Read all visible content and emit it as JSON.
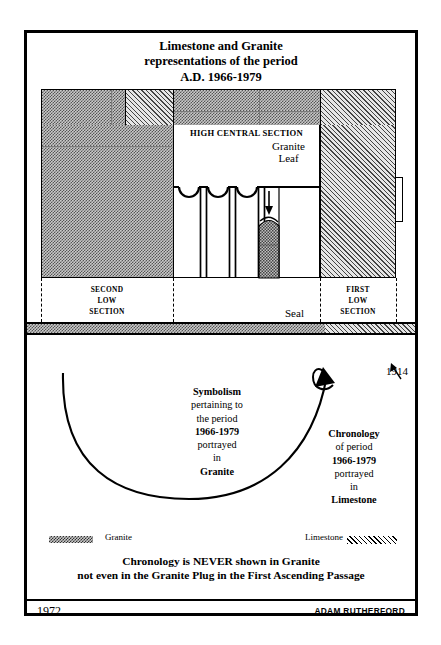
{
  "title": {
    "line1": "Limestone and Granite",
    "line2": "representations of the period",
    "line3": "A.D. 1966-1979"
  },
  "diagram": {
    "high_central_section": "HIGH CENTRAL SECTION",
    "granite_leaf_l1": "Granite",
    "granite_leaf_l2": "Leaf",
    "seal": "Seal",
    "second_low_l1": "SECOND",
    "second_low_l2": "LOW",
    "second_low_l3": "SECTION",
    "first_low_l1": "FIRST",
    "first_low_l2": "LOW",
    "first_low_l3": "SECTION",
    "year_marker": "1914"
  },
  "symbolism": {
    "l1": "Symbolism",
    "l2": "pertaining to",
    "l3": "the period",
    "l4": "1966-1979",
    "l5": "portrayed",
    "l6": "in",
    "l7": "Granite"
  },
  "chronology": {
    "l1": "Chronology",
    "l2": "of period",
    "l3": "1966-1979",
    "l4": "portrayed",
    "l5": "in",
    "l6": "Limestone"
  },
  "legend": {
    "granite_label": "Granite",
    "limestone_label": "Limestone"
  },
  "statement": {
    "line1": "Chronology is NEVER shown in Granite",
    "line2": "not even in the Granite Plug in the First Ascending Passage"
  },
  "footer": {
    "year": "1972",
    "author": "ADAM RUTHERFORD"
  },
  "colors": {
    "ink": "#000000",
    "granite_fill": "#c9c9c9",
    "limestone_fill": "#e6e6e6",
    "page": "#ffffff"
  }
}
